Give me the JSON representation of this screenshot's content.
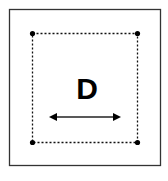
{
  "diagram": {
    "label": "D",
    "outer_border_color": "#333333",
    "dashed_square_color": "#111111",
    "arrow_color": "#222222",
    "corner_points": 4
  }
}
